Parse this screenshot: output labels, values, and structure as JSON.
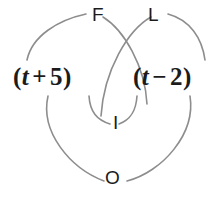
{
  "figure": {
    "name": "FOIL multiplication diagram",
    "background_color": "#ffffff",
    "arc_color": "#8d8d8d",
    "text_color": "#1b1b1b"
  },
  "foil_labels": {
    "first": "F",
    "outer": "O",
    "inner": "I",
    "last": "L"
  },
  "expressions": {
    "left": {
      "open": "(",
      "variable": "t",
      "operator": "+",
      "constant": "5",
      "close": ")"
    },
    "right": {
      "open": "(",
      "variable": "t",
      "operator": "−",
      "constant": "2",
      "close": ")"
    }
  }
}
